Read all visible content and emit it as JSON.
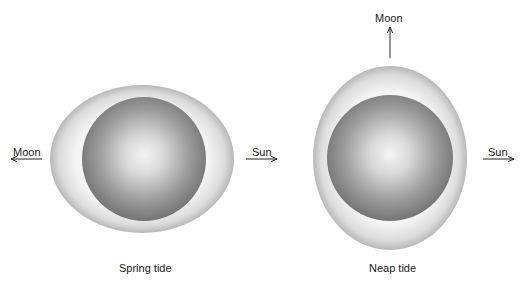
{
  "diagram": {
    "panels": [
      {
        "id": "spring",
        "caption": "Spring tide",
        "moon_label": "Moon",
        "moon_direction": "left",
        "sun_label": "Sun",
        "sun_direction": "right"
      },
      {
        "id": "neap",
        "caption": "Neap tide",
        "moon_label": "Moon",
        "moon_direction": "up",
        "sun_label": "Sun",
        "sun_direction": "right"
      }
    ],
    "colors": {
      "background": "#ffffff",
      "water_bulge_light": "#fafafa",
      "water_bulge_edge": "#b8b8b8",
      "earth_center": "#f2f2f2",
      "earth_edge": "#7a7a7a",
      "arrow": "#222222",
      "text": "#1a1a1a"
    }
  }
}
